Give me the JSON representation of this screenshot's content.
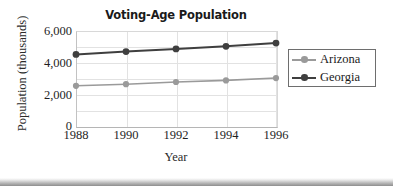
{
  "chart_data": {
    "type": "line",
    "title": "Voting-Age Population",
    "xlabel": "Year",
    "ylabel": "Population (thousands)",
    "x": [
      1988,
      1990,
      1992,
      1994,
      1996
    ],
    "xtick_labels": [
      "1988",
      "1990",
      "1992",
      "1994",
      "1996"
    ],
    "ytick_labels": [
      "0",
      "2,000",
      "4,000",
      "6,000"
    ],
    "ytick_values": [
      0,
      2000,
      4000,
      6000
    ],
    "xlim": [
      1988,
      1996
    ],
    "ylim": [
      0,
      6000
    ],
    "grid": "both",
    "legend_position": "right",
    "series": [
      {
        "name": "Arizona",
        "color": "#9a9a9a",
        "marker": "circle",
        "values": [
          2540,
          2640,
          2780,
          2880,
          3030
        ]
      },
      {
        "name": "Georgia",
        "color": "#3f3f3f",
        "marker": "circle",
        "values": [
          4520,
          4700,
          4870,
          5030,
          5240
        ]
      }
    ]
  },
  "legend": {
    "items": [
      {
        "label": "Arizona"
      },
      {
        "label": "Georgia"
      }
    ]
  }
}
